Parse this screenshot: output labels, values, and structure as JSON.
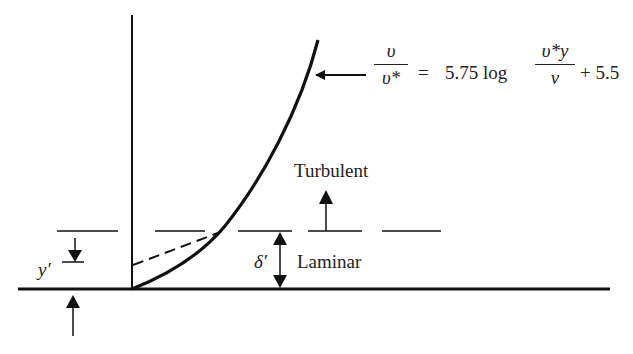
{
  "diagram": {
    "type": "velocity-profile-near-wall",
    "colors": {
      "line": "#111111",
      "text": "#222222",
      "background": "#ffffff"
    },
    "equation": {
      "lhs_numerator": "υ",
      "lhs_denominator": "υ*",
      "equals": "=",
      "coefficient": "5.75 log",
      "rhs_numerator": "υ*y",
      "rhs_denominator": "ν",
      "constant": "+ 5.5"
    },
    "labels": {
      "turbulent": "Turbulent",
      "laminar": "Laminar",
      "delta_prime": "δ′",
      "y_prime": "y′"
    }
  }
}
